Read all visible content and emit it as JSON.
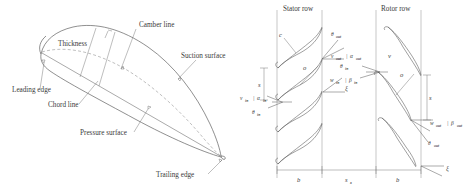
{
  "figure": {
    "panels": [
      {
        "id": "airfoil-nomenclature",
        "labels": {
          "thickness": "Thickness",
          "camber_line": "Camber line",
          "suction_surface": "Suction surface",
          "leading_edge": "Leading edge",
          "chord_line": "Chord line",
          "pressure_surface": "Pressure surface",
          "trailing_edge": "Trailing edge"
        }
      },
      {
        "id": "cascade-rows",
        "titles": {
          "stator": "Stator row",
          "rotor": "Rotor row"
        },
        "symbols": {
          "chord": "c",
          "throat": "o",
          "pitch": "s",
          "axial_chord": "b",
          "axial_gap": "s",
          "axial_gap_sub": "x",
          "stagger": "ξ",
          "velocity_abs": "v",
          "velocity_rel": "w"
        },
        "stator": {
          "inlet_velocity": "v",
          "inlet_velocity_sub": "in",
          "inlet_angle": "α",
          "inlet_angle_sub": "in",
          "inlet_metal": "θ",
          "inlet_metal_sub": "in",
          "outlet_velocity": "v",
          "outlet_velocity_sub": "out",
          "outlet_angle": "α",
          "outlet_angle_sub": "out",
          "outlet_metal": "θ",
          "outlet_metal_sub": "out",
          "separator": "|"
        },
        "rotor": {
          "inlet_velocity": "w",
          "inlet_velocity_sub": "in",
          "inlet_angle": "β",
          "inlet_angle_sub": "in",
          "inlet_metal": "θ",
          "inlet_metal_sub": "in",
          "outlet_velocity": "w",
          "outlet_velocity_sub": "out",
          "outlet_angle": "β",
          "outlet_angle_sub": "out",
          "outlet_metal": "θ",
          "outlet_metal_sub": "out",
          "separator": "|"
        }
      }
    ],
    "colors": {
      "line": "#4a4a4a",
      "dashed": "#8a8a8a",
      "text": "#3a3a3a",
      "background": "#ffffff"
    }
  }
}
